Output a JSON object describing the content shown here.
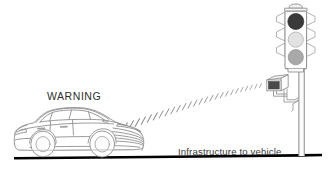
{
  "scene": {
    "title": "Infrastructure to vehicle communication diagram",
    "width": 329,
    "height": 172,
    "background_color": "#ffffff"
  },
  "labels": {
    "warning": "WARNING",
    "caption_line1": "Infrastructure to vehicle",
    "caption_line2": "communication"
  },
  "vehicle": {
    "name": "sedan-car",
    "description": "line-art sedan facing right",
    "outline_color": "#8a8a8a",
    "fill_color": "#ffffff"
  },
  "traffic_light": {
    "name": "traffic-signal",
    "housing_color": "#ffffff",
    "outline_color": "#8d8d8d",
    "lamps": [
      {
        "name": "red-lamp",
        "state": "on",
        "color": "#3a3a3a"
      },
      {
        "name": "yellow-lamp",
        "state": "off",
        "color": "#e2e2e2"
      },
      {
        "name": "green-lamp",
        "state": "off",
        "color": "#a9a9a9"
      }
    ],
    "pole_color": "#9a9a9a"
  },
  "roadside_unit": {
    "name": "roadside-transmitter",
    "lens_color": "#4a4a4a",
    "body_color": "#ffffff",
    "outline_color": "#8d8d8d"
  },
  "signal_beam": {
    "name": "wireless-signal-beam",
    "tick_color": "#8f8f8f",
    "tick_count": 30,
    "direction": "from roadside unit to vehicle"
  },
  "ground": {
    "name": "ground-line",
    "color": "#000000"
  }
}
